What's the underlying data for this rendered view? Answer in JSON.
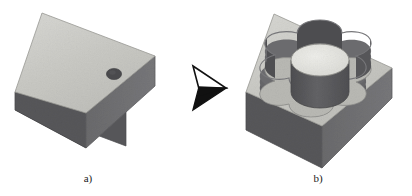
{
  "figure": {
    "background_color": "#ffffff",
    "width": 412,
    "height": 196
  },
  "palette": {
    "top_face": "#c9c9c4",
    "top_face_light": "#d5d5d1",
    "front_face": "#58585a",
    "side_face": "#6e6e70",
    "pocket_floor": "#bdbdb8",
    "pocket_wall_dark": "#4f4f52",
    "pocket_wall_mid": "#707073",
    "boss_top": "#e4e4e0",
    "boss_side": "#5c5c5f",
    "hole_fill": "#4a4a4d",
    "outline": "#8a8a88",
    "arrow_fill": "#111111",
    "caption_color": "#1a1a1a"
  },
  "panels": [
    {
      "id": "panel-a",
      "label": "a)",
      "label_x": 88,
      "label_y": 180,
      "name": "raw-stock-block",
      "features": [
        {
          "type": "drilled-hole",
          "name": "drilled-hole",
          "cx": 114,
          "cy": 74,
          "rx": 7.5,
          "ry": 5.5
        }
      ]
    },
    {
      "id": "panel-b",
      "label": "b)",
      "label_x": 318,
      "label_y": 180,
      "name": "machined-block",
      "features": [
        {
          "type": "gear-pocket",
          "name": "gear-shaped-pocket",
          "lobes": 6
        },
        {
          "type": "cylindrical-boss",
          "name": "central-cylindrical-boss",
          "cx": 320,
          "cy": 60,
          "rx": 29,
          "ry": 16,
          "height": 40
        }
      ]
    }
  ],
  "arrow": {
    "name": "process-arrow",
    "direction": "right",
    "tip_x": 226,
    "tip_y": 88,
    "color": "#111111"
  },
  "captions": {
    "a": "a)",
    "b": "b)"
  }
}
